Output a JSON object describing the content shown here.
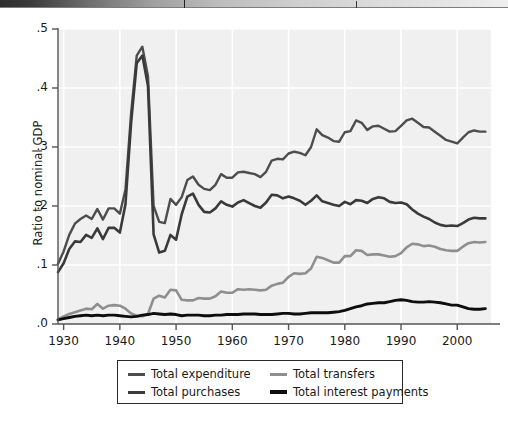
{
  "figure": {
    "ylabel": "Ratio to nominal GDP",
    "ytick_labels": [
      ".5",
      ".4",
      ".3",
      ".2",
      ".1",
      ".0"
    ],
    "xtick_labels": [
      "1930",
      "1940",
      "1950",
      "1960",
      "1970",
      "1980",
      "1990",
      "2000"
    ]
  },
  "legend": {
    "items": [
      {
        "label": "Total expenditure",
        "color": "#4d4d4d"
      },
      {
        "label": "Total transfers",
        "color": "#8f8f8f"
      },
      {
        "label": "Total purchases",
        "color": "#3a3a3a"
      },
      {
        "label": "Total interest payments",
        "color": "#0d0d0d"
      }
    ]
  },
  "colors": {
    "plot_background": "#f0f0f0",
    "gridline": "#ffffff",
    "axis": "#555555",
    "total_expenditure": "#4d4d4d",
    "total_purchases": "#3a3a3a",
    "total_transfers": "#8f8f8f",
    "total_interest_payments": "#0d0d0d"
  },
  "chart_data": {
    "type": "line",
    "title": "",
    "xlabel": "",
    "ylabel": "Ratio to nominal GDP",
    "xlim": [
      1929,
      2006
    ],
    "ylim": [
      0.0,
      0.5
    ],
    "yticks": [
      0.0,
      0.1,
      0.2,
      0.3,
      0.4,
      0.5
    ],
    "ytick_labels": [
      ".0",
      ".1",
      ".2",
      ".3",
      ".4",
      ".5"
    ],
    "xticks": [
      1930,
      1940,
      1950,
      1960,
      1970,
      1980,
      1990,
      2000
    ],
    "grid": true,
    "legend_position": "below-axes",
    "x": [
      1929,
      1930,
      1931,
      1932,
      1933,
      1934,
      1935,
      1936,
      1937,
      1938,
      1939,
      1940,
      1941,
      1942,
      1943,
      1944,
      1945,
      1946,
      1947,
      1948,
      1949,
      1950,
      1951,
      1952,
      1953,
      1954,
      1955,
      1956,
      1957,
      1958,
      1959,
      1960,
      1961,
      1962,
      1963,
      1964,
      1965,
      1966,
      1967,
      1968,
      1969,
      1970,
      1971,
      1972,
      1973,
      1974,
      1975,
      1976,
      1977,
      1978,
      1979,
      1980,
      1981,
      1982,
      1983,
      1984,
      1985,
      1986,
      1987,
      1988,
      1989,
      1990,
      1991,
      1992,
      1993,
      1994,
      1995,
      1996,
      1997,
      1998,
      1999,
      2000,
      2001,
      2002,
      2003,
      2004,
      2005
    ],
    "series": [
      {
        "name": "Total expenditure",
        "color": "#4d4d4d",
        "values": [
          0.102,
          0.123,
          0.151,
          0.17,
          0.178,
          0.184,
          0.178,
          0.195,
          0.177,
          0.196,
          0.196,
          0.187,
          0.228,
          0.357,
          0.455,
          0.47,
          0.42,
          0.2,
          0.173,
          0.171,
          0.212,
          0.202,
          0.215,
          0.244,
          0.25,
          0.236,
          0.229,
          0.227,
          0.236,
          0.254,
          0.248,
          0.248,
          0.257,
          0.258,
          0.256,
          0.254,
          0.249,
          0.258,
          0.277,
          0.28,
          0.279,
          0.289,
          0.292,
          0.29,
          0.286,
          0.3,
          0.33,
          0.32,
          0.316,
          0.31,
          0.309,
          0.325,
          0.327,
          0.345,
          0.341,
          0.329,
          0.335,
          0.336,
          0.331,
          0.326,
          0.327,
          0.336,
          0.345,
          0.348,
          0.341,
          0.334,
          0.333,
          0.326,
          0.319,
          0.312,
          0.309,
          0.306,
          0.316,
          0.325,
          0.328,
          0.326,
          0.326
        ]
      },
      {
        "name": "Total purchases",
        "color": "#3a3a3a",
        "values": [
          0.088,
          0.103,
          0.127,
          0.14,
          0.139,
          0.151,
          0.146,
          0.162,
          0.144,
          0.163,
          0.163,
          0.155,
          0.203,
          0.341,
          0.442,
          0.455,
          0.404,
          0.152,
          0.121,
          0.124,
          0.151,
          0.143,
          0.186,
          0.216,
          0.221,
          0.202,
          0.19,
          0.189,
          0.196,
          0.208,
          0.202,
          0.199,
          0.206,
          0.21,
          0.205,
          0.2,
          0.197,
          0.206,
          0.219,
          0.218,
          0.213,
          0.216,
          0.213,
          0.209,
          0.202,
          0.209,
          0.218,
          0.208,
          0.205,
          0.202,
          0.2,
          0.207,
          0.203,
          0.21,
          0.209,
          0.205,
          0.212,
          0.215,
          0.213,
          0.207,
          0.205,
          0.206,
          0.203,
          0.194,
          0.187,
          0.182,
          0.178,
          0.172,
          0.168,
          0.166,
          0.167,
          0.166,
          0.171,
          0.177,
          0.18,
          0.179,
          0.179
        ]
      },
      {
        "name": "Total transfers",
        "color": "#8f8f8f",
        "values": [
          0.008,
          0.013,
          0.017,
          0.02,
          0.023,
          0.026,
          0.025,
          0.034,
          0.026,
          0.031,
          0.032,
          0.031,
          0.026,
          0.018,
          0.014,
          0.013,
          0.017,
          0.043,
          0.048,
          0.045,
          0.058,
          0.057,
          0.041,
          0.04,
          0.04,
          0.044,
          0.043,
          0.043,
          0.047,
          0.055,
          0.053,
          0.053,
          0.059,
          0.058,
          0.059,
          0.058,
          0.057,
          0.058,
          0.065,
          0.068,
          0.07,
          0.08,
          0.086,
          0.085,
          0.086,
          0.094,
          0.114,
          0.112,
          0.108,
          0.104,
          0.104,
          0.115,
          0.115,
          0.125,
          0.124,
          0.117,
          0.118,
          0.118,
          0.116,
          0.114,
          0.115,
          0.12,
          0.13,
          0.136,
          0.135,
          0.132,
          0.133,
          0.131,
          0.127,
          0.125,
          0.124,
          0.124,
          0.131,
          0.137,
          0.139,
          0.138,
          0.139
        ]
      },
      {
        "name": "Total interest payments",
        "color": "#0d0d0d",
        "values": [
          0.007,
          0.009,
          0.011,
          0.013,
          0.014,
          0.015,
          0.014,
          0.015,
          0.014,
          0.015,
          0.015,
          0.014,
          0.013,
          0.012,
          0.013,
          0.015,
          0.016,
          0.018,
          0.017,
          0.016,
          0.017,
          0.016,
          0.014,
          0.015,
          0.015,
          0.015,
          0.014,
          0.014,
          0.015,
          0.015,
          0.016,
          0.016,
          0.016,
          0.017,
          0.017,
          0.017,
          0.016,
          0.016,
          0.016,
          0.017,
          0.018,
          0.018,
          0.017,
          0.017,
          0.018,
          0.019,
          0.019,
          0.019,
          0.019,
          0.02,
          0.021,
          0.023,
          0.026,
          0.029,
          0.031,
          0.034,
          0.035,
          0.036,
          0.036,
          0.038,
          0.04,
          0.041,
          0.04,
          0.038,
          0.037,
          0.037,
          0.038,
          0.037,
          0.036,
          0.034,
          0.032,
          0.032,
          0.029,
          0.026,
          0.025,
          0.025,
          0.026
        ]
      }
    ]
  }
}
